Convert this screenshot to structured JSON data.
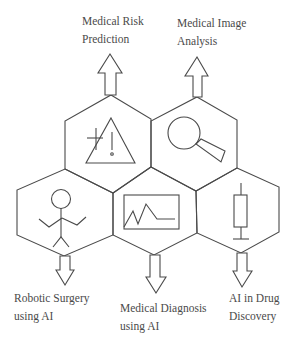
{
  "diagram": {
    "title": "",
    "colors": {
      "line": "#4a4a4a",
      "text": "#4a4a4a",
      "background": "#ffffff"
    },
    "nodes": [
      {
        "id": "risk",
        "label_line1": "Medical Risk",
        "label_line2": "Prediction",
        "icon": "warning-triangle-icon",
        "arrow": "up"
      },
      {
        "id": "image",
        "label_line1": "Medical Image",
        "label_line2": "Analysis",
        "icon": "magnifying-glass-icon",
        "arrow": "up"
      },
      {
        "id": "surgery",
        "label_line1": "Robotic Surgery",
        "label_line2": "using AI",
        "icon": "stick-figure-robot-icon",
        "arrow": "down"
      },
      {
        "id": "diagnosis",
        "label_line1": "Medical Diagnosis",
        "label_line2": "using AI",
        "icon": "line-chart-monitor-icon",
        "arrow": "down"
      },
      {
        "id": "drug",
        "label_line1": "AI in Drug",
        "label_line2": "Discovery",
        "icon": "syringe-icon",
        "arrow": "down"
      }
    ]
  }
}
